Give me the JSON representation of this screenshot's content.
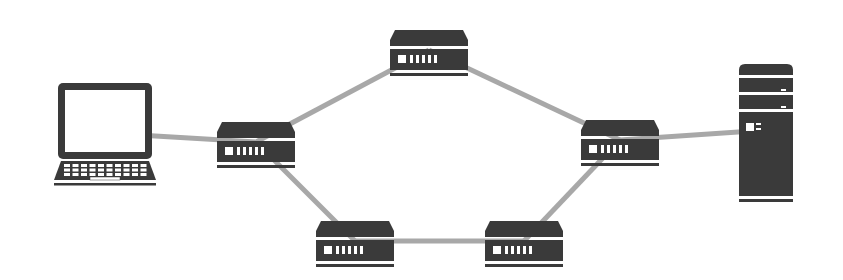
{
  "diagram": {
    "title": "Network topology",
    "colors": {
      "background": "#ffffff",
      "device": "#3a3a3a",
      "device_light": "#ffffff",
      "link": "#a8a8a8"
    },
    "nodes": [
      {
        "id": "laptop",
        "type": "laptop",
        "label": "Laptop",
        "x": 105,
        "y": 133
      },
      {
        "id": "router-1",
        "type": "router",
        "label": "Router 1",
        "x": 256,
        "y": 142
      },
      {
        "id": "router-2",
        "type": "router",
        "label": "Router 2",
        "x": 429,
        "y": 50
      },
      {
        "id": "router-3",
        "type": "router",
        "label": "Router 3",
        "x": 620,
        "y": 140
      },
      {
        "id": "router-4",
        "type": "router",
        "label": "Router 4",
        "x": 355,
        "y": 241
      },
      {
        "id": "router-5",
        "type": "router",
        "label": "Router 5",
        "x": 524,
        "y": 241
      },
      {
        "id": "server",
        "type": "server",
        "label": "Server",
        "x": 766,
        "y": 130
      }
    ],
    "links": [
      {
        "from": "laptop",
        "to": "router-1"
      },
      {
        "from": "router-1",
        "to": "router-2"
      },
      {
        "from": "router-2",
        "to": "router-3"
      },
      {
        "from": "router-3",
        "to": "server"
      },
      {
        "from": "router-1",
        "to": "router-4"
      },
      {
        "from": "router-4",
        "to": "router-5"
      },
      {
        "from": "router-5",
        "to": "router-3"
      }
    ]
  }
}
